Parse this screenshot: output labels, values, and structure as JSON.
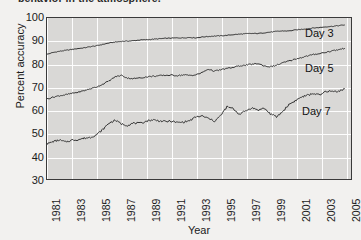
{
  "caption": {
    "text": "behavior in the atmosphere."
  },
  "chart_data": {
    "type": "line",
    "title": "",
    "xlabel": "Year",
    "ylabel": "Percent accuracy",
    "xlim": [
      1981,
      2005.5
    ],
    "ylim": [
      30,
      100
    ],
    "grid": true,
    "legend_position": "inline-right",
    "xticks": [
      "1981",
      "1983",
      "1985",
      "1987",
      "1989",
      "1991",
      "1993",
      "1995",
      "1997",
      "1999",
      "2001",
      "2003",
      "2005"
    ],
    "yticks": [
      "30",
      "40",
      "50",
      "60",
      "70",
      "80",
      "90",
      "100"
    ],
    "colors": {
      "plot_background": "#d9d8d6",
      "gridline": "#fdfdfd",
      "axis": "#3a3a3a",
      "line": "#333333",
      "page_background": "#f2f1ef"
    },
    "series": [
      {
        "name": "Day 3",
        "label": "Day 3",
        "x": [
          1981.0,
          1981.5,
          1982.0,
          1982.5,
          1983.0,
          1983.5,
          1984.0,
          1984.5,
          1985.0,
          1985.5,
          1986.0,
          1986.5,
          1987.0,
          1987.5,
          1988.0,
          1988.5,
          1989.0,
          1989.5,
          1990.0,
          1990.5,
          1991.0,
          1991.5,
          1992.0,
          1992.5,
          1993.0,
          1993.5,
          1994.0,
          1994.5,
          1995.0,
          1995.5,
          1996.0,
          1996.5,
          1997.0,
          1997.5,
          1998.0,
          1998.5,
          1999.0,
          1999.5,
          2000.0,
          2000.5,
          2001.0,
          2001.5,
          2002.0,
          2002.5,
          2003.0,
          2003.5,
          2004.0,
          2004.5,
          2005.0
        ],
        "values": [
          84.3,
          85.1,
          85.6,
          86.0,
          86.4,
          86.8,
          87.1,
          87.6,
          88.0,
          88.6,
          89.2,
          89.6,
          89.9,
          90.0,
          90.2,
          90.5,
          90.6,
          90.8,
          91.0,
          91.2,
          91.3,
          91.4,
          91.4,
          91.6,
          91.4,
          91.8,
          92.0,
          92.2,
          92.3,
          92.5,
          92.8,
          93.0,
          93.2,
          93.3,
          93.3,
          93.6,
          93.9,
          94.2,
          94.4,
          94.4,
          94.8,
          95.1,
          95.4,
          95.7,
          95.9,
          96.2,
          96.4,
          96.7,
          97.0
        ]
      },
      {
        "name": "Day 5",
        "label": "Day 5",
        "x": [
          1981.0,
          1981.5,
          1982.0,
          1982.5,
          1983.0,
          1983.5,
          1984.0,
          1984.5,
          1985.0,
          1985.5,
          1986.0,
          1986.5,
          1987.0,
          1987.5,
          1988.0,
          1988.5,
          1989.0,
          1989.5,
          1990.0,
          1990.5,
          1991.0,
          1991.5,
          1992.0,
          1992.5,
          1993.0,
          1993.5,
          1994.0,
          1994.5,
          1995.0,
          1995.5,
          1996.0,
          1996.5,
          1997.0,
          1997.5,
          1998.0,
          1998.5,
          1999.0,
          1999.5,
          2000.0,
          2000.5,
          2001.0,
          2001.5,
          2002.0,
          2002.5,
          2003.0,
          2003.5,
          2004.0,
          2004.5,
          2005.0
        ],
        "values": [
          65.0,
          65.8,
          66.4,
          66.8,
          67.4,
          67.9,
          68.6,
          69.4,
          70.2,
          71.4,
          72.8,
          74.6,
          75.2,
          74.0,
          73.8,
          74.1,
          74.5,
          74.8,
          75.0,
          75.2,
          75.3,
          75.1,
          75.4,
          75.2,
          75.4,
          76.4,
          77.9,
          77.0,
          77.6,
          78.2,
          78.6,
          79.3,
          79.6,
          80.0,
          80.3,
          79.3,
          78.9,
          79.6,
          80.6,
          81.4,
          82.2,
          82.9,
          83.6,
          84.2,
          84.7,
          85.2,
          85.8,
          86.3,
          86.9
        ]
      },
      {
        "name": "Day 7",
        "label": "Day 7",
        "x": [
          1981.0,
          1981.5,
          1982.0,
          1982.5,
          1983.0,
          1983.5,
          1984.0,
          1984.5,
          1985.0,
          1985.5,
          1986.0,
          1986.5,
          1987.0,
          1987.5,
          1988.0,
          1988.5,
          1989.0,
          1989.5,
          1990.0,
          1990.5,
          1991.0,
          1991.5,
          1992.0,
          1992.5,
          1993.0,
          1993.5,
          1994.0,
          1994.5,
          1995.0,
          1995.5,
          1996.0,
          1996.5,
          1997.0,
          1997.5,
          1998.0,
          1998.5,
          1999.0,
          1999.5,
          2000.0,
          2000.5,
          2001.0,
          2001.5,
          2002.0,
          2002.5,
          2003.0,
          2003.5,
          2004.0,
          2004.5,
          2005.0
        ],
        "values": [
          45.5,
          46.6,
          47.2,
          46.4,
          47.2,
          47.4,
          48.0,
          48.4,
          49.6,
          51.8,
          54.6,
          55.8,
          54.2,
          53.6,
          54.6,
          54.4,
          55.4,
          56.0,
          55.6,
          55.2,
          55.4,
          54.8,
          55.0,
          55.6,
          57.2,
          57.6,
          56.6,
          55.4,
          57.8,
          61.6,
          60.8,
          58.4,
          59.8,
          61.2,
          60.2,
          61.0,
          58.6,
          57.2,
          59.6,
          62.6,
          64.2,
          65.8,
          66.6,
          67.4,
          66.6,
          68.4,
          68.2,
          68.4,
          69.4
        ]
      }
    ]
  }
}
